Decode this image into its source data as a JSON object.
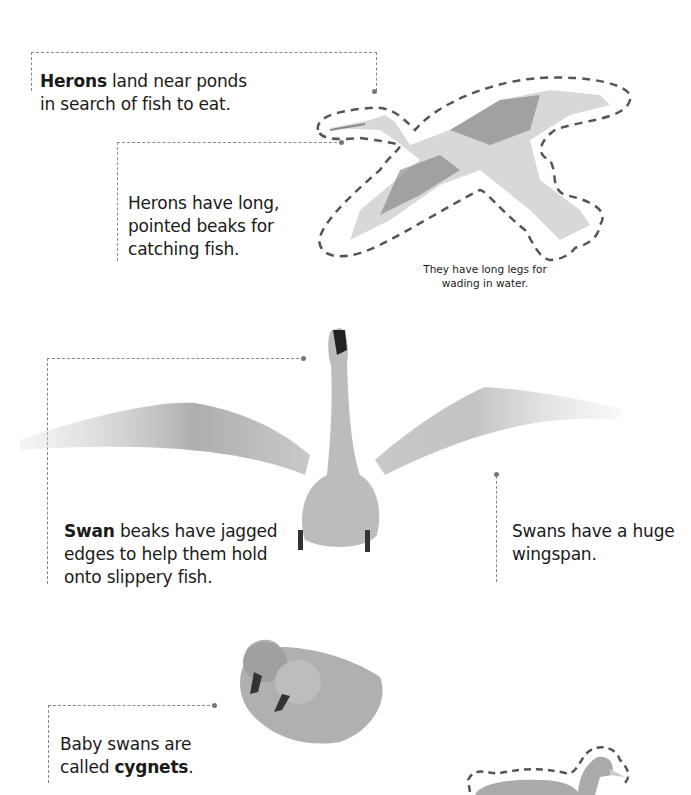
{
  "heron_section": {
    "intro": {
      "bold": "Herons",
      "rest_line1": " land near ponds",
      "line2": "in search of fish to eat."
    },
    "beak_caption": {
      "line1": "Herons have long,",
      "line2": "pointed beaks for",
      "line3": "catching fish."
    },
    "legs_caption": {
      "line1": "They have long legs for",
      "line2": "wading in water."
    },
    "illustration": "flying-heron-cutout"
  },
  "swan_section": {
    "beak_caption": {
      "bold": "Swan",
      "rest_line1": " beaks have jagged",
      "line2": "edges to help them hold",
      "line3": "onto slippery fish."
    },
    "wingspan_caption": {
      "line1": "Swans have a huge",
      "line2": "wingspan."
    },
    "illustration": "swan-spread-wings-photo"
  },
  "cygnet_section": {
    "caption": {
      "line1": "Baby swans are",
      "line2_prefix": "called ",
      "bold": "cygnets",
      "line2_suffix": "."
    },
    "illustration": "two-cygnets-photo"
  },
  "footer_illustration": "swimming-swan-cutout",
  "colors": {
    "text": "#1a1a1a",
    "leader": "#888888",
    "cutout_outline": "#555555",
    "image_gray": "#9a9a9a"
  }
}
